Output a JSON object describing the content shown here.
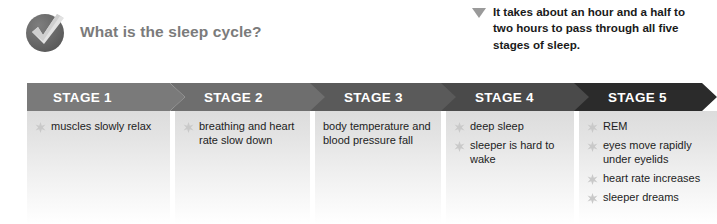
{
  "header": {
    "badge_icon": "check-badge-icon",
    "title": "What is the sleep cycle?"
  },
  "callout": {
    "marker_icon": "triangle-down-icon",
    "text": "It takes about an hour and a half to two hours to pass through all five stages of sleep."
  },
  "colors": {
    "stage1_banner": "#7a7a7a",
    "stage2_banner": "#6e6e6e",
    "stage3_banner": "#5a5a5a",
    "stage4_banner": "#4a4a4a",
    "stage5_banner": "#2b2b2b",
    "banner_text": "#ffffff",
    "title_text": "#7b7b7b",
    "body_text": "#1d1d1d",
    "bullet": "#c9c9c9",
    "callout_marker": "#9a9a9a"
  },
  "chart_data": {
    "type": "diagram",
    "title": "What is the sleep cycle?",
    "layout": "horizontal chevron process flow, 5 sequential stages, left to right",
    "categories": [
      "STAGE 1",
      "STAGE 2",
      "STAGE 3",
      "STAGE 4",
      "STAGE 5"
    ],
    "annotation": "It takes about an hour and a half to two hours to pass through all five stages of sleep.",
    "series": [
      {
        "name": "STAGE 1",
        "items": [
          "muscles slowly relax"
        ]
      },
      {
        "name": "STAGE 2",
        "items": [
          "breathing and heart rate slow down"
        ]
      },
      {
        "name": "STAGE 3",
        "items": [
          "body temperature and blood pressure fall"
        ]
      },
      {
        "name": "STAGE 4",
        "items": [
          "deep sleep",
          "sleeper is hard to wake"
        ]
      },
      {
        "name": "STAGE 5",
        "items": [
          "REM",
          "eyes move rapidly under eyelids",
          "heart rate increases",
          "sleeper dreams"
        ]
      }
    ]
  },
  "stages": [
    {
      "label": "STAGE 1",
      "bullets": [
        {
          "text": "muscles slowly relax",
          "marker": true
        }
      ]
    },
    {
      "label": "STAGE 2",
      "bullets": [
        {
          "text": "breathing and heart rate slow down",
          "marker": true
        }
      ]
    },
    {
      "label": "STAGE 3",
      "bullets": [
        {
          "text": "body temperature and blood pressure fall",
          "marker": false
        }
      ]
    },
    {
      "label": "STAGE 4",
      "bullets": [
        {
          "text": "deep sleep",
          "marker": true
        },
        {
          "text": "sleeper is hard to wake",
          "marker": true
        }
      ]
    },
    {
      "label": "STAGE 5",
      "bullets": [
        {
          "text": "REM",
          "marker": true
        },
        {
          "text": "eyes move rapidly under eyelids",
          "marker": true
        },
        {
          "text": "heart rate increases",
          "marker": true
        },
        {
          "text": "sleeper dreams",
          "marker": true
        }
      ]
    }
  ]
}
